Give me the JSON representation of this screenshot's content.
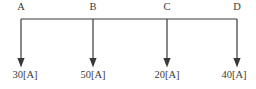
{
  "diagram": {
    "type": "electrical-bus-branch-diagram",
    "canvas": {
      "width": 256,
      "height": 89,
      "background": "#ffffff"
    },
    "line_color": "#3a3a3a",
    "text_color": "#3a3a3a",
    "bus": {
      "y": 19,
      "x_start": 21,
      "x_end": 237
    },
    "nodes": [
      {
        "id": "A",
        "label": "A",
        "x": 21,
        "current_label": "30[A]",
        "current_value": 30,
        "unit": "[A]",
        "arrow_top_y": 19,
        "arrow_tip_y": 67
      },
      {
        "id": "B",
        "label": "B",
        "x": 93,
        "current_label": "50[A]",
        "current_value": 50,
        "unit": "[A]",
        "arrow_top_y": 19,
        "arrow_tip_y": 67
      },
      {
        "id": "C",
        "label": "C",
        "x": 167,
        "current_label": "20[A]",
        "current_value": 20,
        "unit": "[A]",
        "arrow_top_y": 19,
        "arrow_tip_y": 67
      },
      {
        "id": "D",
        "label": "D",
        "x": 237,
        "current_label": "40[A]",
        "current_value": 40,
        "unit": "[A]",
        "arrow_top_y": 19,
        "arrow_tip_y": 67
      }
    ]
  }
}
